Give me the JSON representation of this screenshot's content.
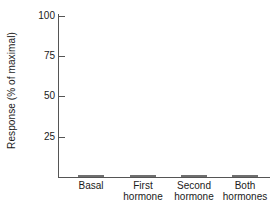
{
  "chart_data": {
    "type": "bar",
    "title": "",
    "xlabel": "",
    "ylabel": "Response (% of maximal)",
    "categories": [
      "Basal",
      "First hormone",
      "Second hormone",
      "Both hormones"
    ],
    "category_lines": [
      [
        "Basal",
        ""
      ],
      [
        "First",
        "hormone"
      ],
      [
        "Second",
        "hormone"
      ],
      [
        "Both",
        "hormones"
      ]
    ],
    "values": [
      15,
      20,
      20,
      100
    ],
    "ylim": [
      0,
      100
    ],
    "yticks": [
      25,
      50,
      75,
      100
    ],
    "ytick_labels": [
      "25",
      "50",
      "75",
      "100"
    ],
    "grid": false,
    "legend": null,
    "bar_color": "#a9a9a9",
    "bar_edge_color": "#6f6f6f",
    "axis_color": "#555555"
  }
}
